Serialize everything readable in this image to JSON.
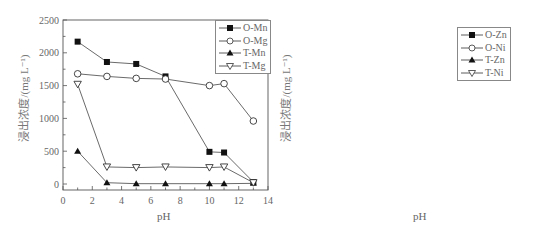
{
  "chart_data": [
    {
      "type": "line",
      "title": "",
      "xlabel": "pH",
      "ylabel": "浸出浓度/(mg L⁻¹)",
      "xlim": [
        0,
        14
      ],
      "ylim": [
        0,
        2500
      ],
      "xticks": [
        0,
        2,
        4,
        6,
        8,
        10,
        12,
        14
      ],
      "yticks": [
        0,
        500,
        1000,
        1500,
        2000,
        2500
      ],
      "grid": false,
      "legend_position": "upper right",
      "series": [
        {
          "name": "O-Mn",
          "marker": "filled-square",
          "x": [
            1,
            3,
            5,
            7,
            10,
            11,
            13
          ],
          "y": [
            2170,
            1860,
            1830,
            1640,
            490,
            480,
            30
          ]
        },
        {
          "name": "O-Mg",
          "marker": "open-circle",
          "x": [
            1,
            3,
            5,
            7,
            10,
            11,
            13
          ],
          "y": [
            1680,
            1640,
            1610,
            1600,
            1500,
            1530,
            960
          ]
        },
        {
          "name": "T-Mn",
          "marker": "filled-triangle-up",
          "x": [
            1,
            3,
            5,
            7,
            10,
            11,
            13
          ],
          "y": [
            500,
            20,
            5,
            5,
            5,
            5,
            10
          ]
        },
        {
          "name": "T-Mg",
          "marker": "open-triangle-down",
          "x": [
            1,
            3,
            5,
            7,
            10,
            11,
            13
          ],
          "y": [
            1520,
            260,
            250,
            260,
            250,
            260,
            20
          ]
        }
      ]
    },
    {
      "type": "line",
      "title": "",
      "xlabel": "pH",
      "ylabel": "浸出浓度/(mg L⁻¹)",
      "xlim": [
        0,
        14
      ],
      "ylim": [
        -2.5,
        42
      ],
      "axis_break": {
        "between": [
          19,
          38
        ]
      },
      "xticks": [
        0,
        2,
        4,
        6,
        8,
        10,
        12,
        14
      ],
      "yticks": [
        0,
        5,
        10,
        15,
        40
      ],
      "grid": false,
      "legend_position": "upper right",
      "series": [
        {
          "name": "O-Zn",
          "marker": "filled-square",
          "x": [
            1,
            3,
            4,
            5,
            7,
            10,
            11,
            13
          ],
          "y": [
            38.8,
            6.6,
            4.2,
            5.4,
            4.6,
            4.0,
            5.4,
            2.7
          ]
        },
        {
          "name": "O-Ni",
          "marker": "open-circle",
          "x": [
            1,
            3,
            7,
            10,
            11,
            13
          ],
          "y": [
            9.1,
            3.1,
            2.4,
            2.4,
            2.0,
            0.0
          ]
        },
        {
          "name": "T-Zn",
          "marker": "filled-triangle-up",
          "x": [
            1,
            3,
            5,
            7,
            10,
            11,
            13
          ],
          "y": [
            17.8,
            2.4,
            2.7,
            2.9,
            2.7,
            2.7,
            2.1
          ]
        },
        {
          "name": "T-Ni",
          "marker": "open-triangle-down",
          "x": [
            1,
            3,
            5,
            7,
            10,
            11,
            13
          ],
          "y": [
            14.6,
            0.1,
            -0.1,
            0.0,
            0.1,
            -0.1,
            -0.1
          ]
        }
      ]
    }
  ],
  "left": {
    "ylabel": "浸出浓度/(mg L⁻¹)",
    "xlabel": "pH",
    "legend": [
      "O-Mn",
      "O-Mg",
      "T-Mn",
      "T-Mg"
    ]
  },
  "right": {
    "ylabel": "浸出浓度/(mg L⁻¹)",
    "xlabel": "pH",
    "legend": [
      "O-Zn",
      "O-Ni",
      "T-Zn",
      "T-Ni"
    ]
  }
}
